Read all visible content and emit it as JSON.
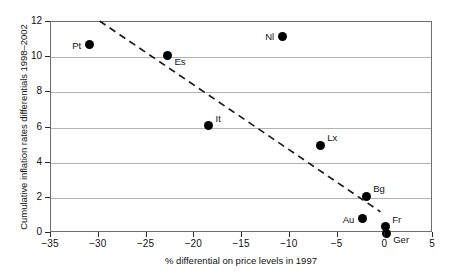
{
  "chart_data": {
    "type": "scatter",
    "title": "",
    "xlabel": "% differential on price levels in 1997",
    "ylabel": "Cumulative inflation rates differentials 1998–2002",
    "xlim": [
      -35,
      5
    ],
    "ylim": [
      0,
      12
    ],
    "xticks": [
      -35,
      -30,
      -25,
      -20,
      -15,
      -10,
      -5,
      0,
      5
    ],
    "xtick_labels": [
      "−35",
      "−30",
      "−25",
      "−20",
      "−15",
      "−10",
      "−5",
      "0",
      "5"
    ],
    "yticks": [
      0,
      2,
      4,
      6,
      8,
      10,
      12
    ],
    "ytick_labels": [
      "0",
      "2",
      "4",
      "6",
      "8",
      "10",
      "12"
    ],
    "grid": "horizontal",
    "legend": "none",
    "marker_color": "#000000",
    "gridline_color": "#b3b3b3",
    "frame_color": "#6e6e6e",
    "points": [
      {
        "label": "Pt",
        "x": -31.0,
        "y": 10.7,
        "label_pos": "left"
      },
      {
        "label": "Es",
        "x": -22.8,
        "y": 10.1,
        "label_pos": "below-right"
      },
      {
        "label": "It",
        "x": -18.5,
        "y": 6.1,
        "label_pos": "above-right"
      },
      {
        "label": "Nl",
        "x": -10.8,
        "y": 11.2,
        "label_pos": "left"
      },
      {
        "label": "Lx",
        "x": -6.8,
        "y": 5.0,
        "label_pos": "above-right"
      },
      {
        "label": "Bg",
        "x": -2.0,
        "y": 2.1,
        "label_pos": "above-right"
      },
      {
        "label": "Au",
        "x": -2.4,
        "y": 0.8,
        "label_pos": "left"
      },
      {
        "label": "Fr",
        "x": 0.0,
        "y": 0.35,
        "label_pos": "above-right"
      },
      {
        "label": "Ger",
        "x": 0.1,
        "y": 0.0,
        "label_pos": "below-right"
      }
    ],
    "trendline": {
      "style": "dashed",
      "color": "#1a1a1a",
      "x_start": -29.8,
      "y_start": 12.0,
      "x_end": -0.4,
      "y_end": 1.15
    }
  }
}
